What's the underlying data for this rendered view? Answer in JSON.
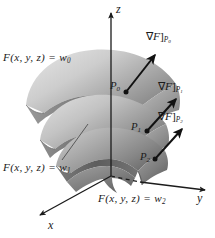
{
  "figure": {
    "kind": "3d-level-surface-gradient-diagram",
    "background_color": "#ffffff",
    "ink_color": "#1b1b1b"
  },
  "axes": {
    "z": {
      "label": "z",
      "direction": "up",
      "has_arrow": true,
      "dashed_behind_surfaces": true
    },
    "y": {
      "label": "y",
      "direction": "right",
      "has_arrow": true,
      "dashed_behind_surfaces": true
    },
    "x": {
      "label": "x",
      "direction": "down-left",
      "has_arrow": true,
      "dashed_behind_surfaces": false
    }
  },
  "level_surfaces": [
    {
      "id": "w0",
      "label_prefix": "F(x, y, z)  =  ",
      "label_var": "w",
      "label_sub": "0",
      "fill_light": "#d9d9d9",
      "fill_dark": "#8a8a8a",
      "edge_color": "#4a4a4a",
      "note": "outermost / highest dome"
    },
    {
      "id": "w1",
      "label_prefix": "F(x, y, z)  =  ",
      "label_var": "w",
      "label_sub": "1",
      "fill_light": "#cfcfcf",
      "fill_dark": "#7e7e7e",
      "edge_color": "#4a4a4a",
      "has_leader_line": true,
      "note": "middle dome"
    },
    {
      "id": "w2",
      "label_prefix": "F(x, y, z)  =  ",
      "label_var": "w",
      "label_sub": "2",
      "fill_light": "#b8b8b8",
      "fill_dark": "#6a6a6a",
      "edge_color": "#3d3d3d",
      "note": "innermost / lowest dome"
    }
  ],
  "points": [
    {
      "id": "P0",
      "label_var": "P",
      "label_sub": "0",
      "on_surface": "w0",
      "dot_color": "#1b1b1b"
    },
    {
      "id": "P1",
      "label_var": "P",
      "label_sub": "1",
      "on_surface": "w1",
      "dot_color": "#1b1b1b"
    },
    {
      "id": "P2",
      "label_var": "P",
      "label_sub": "2",
      "on_surface": "w2",
      "dot_color": "#1b1b1b"
    }
  ],
  "gradients": [
    {
      "id": "gradP0",
      "nabla": "∇",
      "fn": "F",
      "bracket": "]",
      "at_point_var": "P",
      "at_point_sub": "0",
      "arrow_color": "#121212",
      "direction": "up-right"
    },
    {
      "id": "gradP1",
      "nabla": "∇",
      "fn": "F",
      "bracket": "]",
      "at_point_var": "P",
      "at_point_sub": "1",
      "arrow_color": "#121212",
      "direction": "up-right"
    },
    {
      "id": "gradP2",
      "nabla": "∇",
      "fn": "F",
      "bracket": "]",
      "at_point_var": "P",
      "at_point_sub": "2",
      "arrow_color": "#121212",
      "direction": "up-right"
    }
  ]
}
